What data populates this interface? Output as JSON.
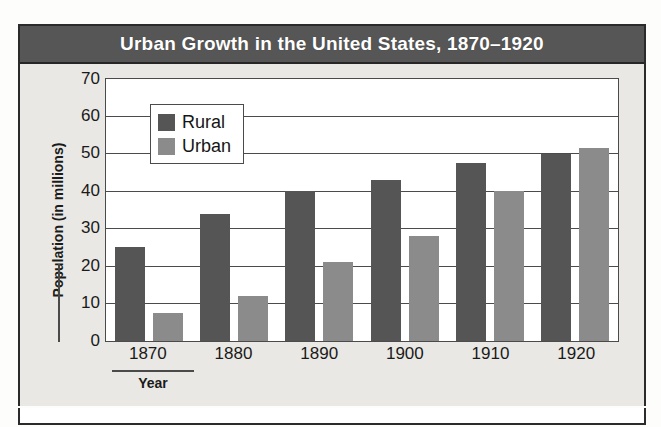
{
  "figure": {
    "title": "Urban Growth in the United States, 1870–1920",
    "caption": ""
  },
  "colors": {
    "title_bar_bg": "#565656",
    "title_text": "#ffffff",
    "chart_bg": "#e9e8e4",
    "plot_bg": "#ffffff",
    "axis_line": "#4b4b4b",
    "rural": "#555555",
    "urban": "#8b8b8b",
    "frame": "#2b2b2b"
  },
  "legend": {
    "position": "top-left-inside",
    "entries": [
      {
        "label": "Rural",
        "color": "#555555",
        "swatch": "rural-swatch"
      },
      {
        "label": "Urban",
        "color": "#8b8b8b",
        "swatch": "urban-swatch"
      }
    ]
  },
  "axes": {
    "x_title": "Year",
    "y_title": "Population (in millions)",
    "y_ticks": [
      "70",
      "60",
      "50",
      "40",
      "30",
      "20",
      "10",
      "0"
    ]
  },
  "chart_data": {
    "type": "bar",
    "title": "Urban Growth in the United States, 1870–1920",
    "xlabel": "Year",
    "ylabel": "Population (in millions)",
    "categories": [
      "1870",
      "1880",
      "1890",
      "1900",
      "1910",
      "1920"
    ],
    "series": [
      {
        "name": "Rural",
        "color": "#555555",
        "values": [
          25,
          34,
          40,
          43,
          47.5,
          50
        ]
      },
      {
        "name": "Urban",
        "color": "#8b8b8b",
        "values": [
          7.5,
          12,
          21,
          28,
          40,
          51.5
        ]
      }
    ],
    "ylim": [
      0,
      70
    ],
    "ytick_step": 10,
    "grid": "horizontal",
    "legend_position": "upper-left"
  }
}
